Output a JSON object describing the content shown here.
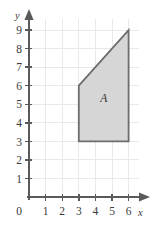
{
  "chart_data": {
    "type": "scatter",
    "title": "",
    "subtitle": "",
    "xlabel": "x",
    "ylabel": "y",
    "xlim": [
      0,
      6.6
    ],
    "ylim": [
      0,
      9.6
    ],
    "grid": true,
    "legend": null,
    "x_ticks": [
      0,
      1,
      2,
      3,
      4,
      5,
      6
    ],
    "y_ticks": [
      0,
      1,
      2,
      3,
      4,
      5,
      6,
      7,
      8,
      9
    ],
    "x_tick_labels": [
      "0",
      "1",
      "2",
      "3",
      "4",
      "5",
      "6"
    ],
    "y_tick_labels": [
      "0",
      "1",
      "2",
      "3",
      "4",
      "5",
      "6",
      "7",
      "8",
      "9"
    ],
    "origin_label": "0",
    "shapes": [
      {
        "name": "A",
        "kind": "polygon",
        "label": "A",
        "label_position": [
          4.5,
          5.1
        ],
        "vertices": [
          [
            3,
            3
          ],
          [
            6,
            3
          ],
          [
            6,
            9
          ],
          [
            3,
            6
          ]
        ],
        "fill": "#d6d6d6",
        "stroke": "#6d6d6d"
      }
    ],
    "annotations": [
      {
        "text": "A",
        "x": 4.5,
        "y": 5.1
      }
    ]
  },
  "axes": {
    "x_axis_name": "x",
    "y_axis_name": "y",
    "x_arrow": "arrow-right",
    "y_arrow": "arrow-up"
  },
  "colors": {
    "grid": "#e9e9e9",
    "axis": "#5a5a5a",
    "region_fill": "#d6d6d6",
    "region_stroke": "#6d6d6d",
    "text": "#3a3a3a",
    "background": "#ffffff"
  }
}
